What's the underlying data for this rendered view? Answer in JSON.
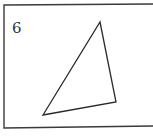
{
  "figure": {
    "number_label": "6",
    "frame_color": "#3a3a3a",
    "stroke_color": "#2a2a2a",
    "triangle": {
      "vertices": [
        [
          100,
          22
        ],
        [
          116,
          102
        ],
        [
          43,
          115
        ]
      ]
    }
  }
}
